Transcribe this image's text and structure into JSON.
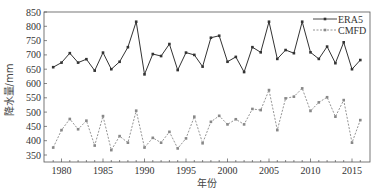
{
  "chart_data": {
    "type": "line",
    "title": "",
    "xlabel": "年份",
    "ylabel": "降水量/mm",
    "xlim": [
      1978,
      2017
    ],
    "ylim": [
      325,
      850
    ],
    "yticks": [
      350,
      400,
      450,
      500,
      550,
      600,
      650,
      700,
      750,
      800,
      850
    ],
    "xticks": [
      1980,
      1985,
      1990,
      1995,
      2000,
      2005,
      2010,
      2015
    ],
    "grid": false,
    "legend_position": "upper right",
    "x": [
      1979,
      1980,
      1981,
      1982,
      1983,
      1984,
      1985,
      1986,
      1987,
      1988,
      1989,
      1990,
      1991,
      1992,
      1993,
      1994,
      1995,
      1996,
      1997,
      1998,
      1999,
      2000,
      2001,
      2002,
      2003,
      2004,
      2005,
      2006,
      2007,
      2008,
      2009,
      2010,
      2011,
      2012,
      2013,
      2014,
      2015,
      2016
    ],
    "series": [
      {
        "name": "ERA5",
        "style": "solid",
        "color": "#333333",
        "values": [
          657,
          673,
          706,
          673,
          685,
          645,
          708,
          650,
          676,
          727,
          816,
          632,
          703,
          696,
          738,
          647,
          708,
          700,
          659,
          760,
          767,
          676,
          693,
          640,
          727,
          709,
          816,
          686,
          717,
          706,
          816,
          709,
          686,
          729,
          671,
          744,
          650,
          682
        ]
      },
      {
        "name": "CMFD",
        "style": "dashed",
        "color": "#888888",
        "values": [
          376,
          437,
          476,
          440,
          470,
          383,
          486,
          367,
          416,
          393,
          505,
          376,
          410,
          393,
          431,
          373,
          408,
          484,
          391,
          466,
          487,
          457,
          475,
          457,
          511,
          507,
          577,
          437,
          548,
          554,
          583,
          504,
          534,
          552,
          484,
          542,
          393,
          472
        ]
      }
    ]
  }
}
